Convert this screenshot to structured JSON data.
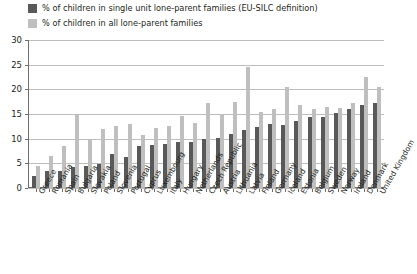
{
  "chart_data": {
    "type": "bar",
    "title": "",
    "xlabel": "",
    "ylabel": "",
    "ylim": [
      0,
      30
    ],
    "yticks": [
      0,
      5,
      10,
      15,
      20,
      25,
      30
    ],
    "grid": true,
    "legend_position": "top-left",
    "categories": [
      "Greece",
      "Romania",
      "Spain",
      "Bulgaria",
      "Slovakia",
      "Poland",
      "Slovenia",
      "Portugal",
      "Cyprus",
      "Luxembourg",
      "Italy",
      "Hungary",
      "Netherlands",
      "Czech Republic",
      "Austria",
      "Lithuania",
      "Latvia",
      "Finland",
      "Germany",
      "Iceland",
      "Estonia",
      "Belgium",
      "Sweden",
      "Norway",
      "Ireland",
      "Denmark",
      "United Kingdom"
    ],
    "series": [
      {
        "name": "% of children in single unit lone-parent families (EU-SILC definition)",
        "color": "#595959",
        "values": [
          2.5,
          3.5,
          3.5,
          4.2,
          4.5,
          4.8,
          6.8,
          6.3,
          8.5,
          8.8,
          9.0,
          9.3,
          9.4,
          10.0,
          10.2,
          11.0,
          11.8,
          12.3,
          13.0,
          12.7,
          13.6,
          14.3,
          14.4,
          15.3,
          16.0,
          16.8,
          17.3
        ]
      },
      {
        "name": "% of children in all lone-parent families",
        "color": "#bfbfbf",
        "values": [
          4.5,
          6.5,
          8.5,
          15.0,
          9.8,
          12.0,
          12.6,
          13.0,
          10.8,
          12.2,
          12.6,
          14.6,
          13.2,
          17.3,
          14.7,
          17.5,
          24.5,
          15.5,
          16.0,
          20.5,
          16.8,
          16.0,
          16.5,
          16.2,
          17.3,
          22.5,
          20.5
        ]
      }
    ]
  },
  "legend": {
    "items": [
      {
        "label": "% of children in single unit lone-parent families (EU-SILC definition)",
        "color": "#595959"
      },
      {
        "label": "% of children in all lone-parent families",
        "color": "#bfbfbf"
      }
    ]
  },
  "colors": {
    "dark_series": "#595959",
    "light_series": "#bfbfbf",
    "gridline": "#bdbdbd",
    "axis": "#6e6e6e",
    "text": "#231f20",
    "background": "#ffffff"
  }
}
